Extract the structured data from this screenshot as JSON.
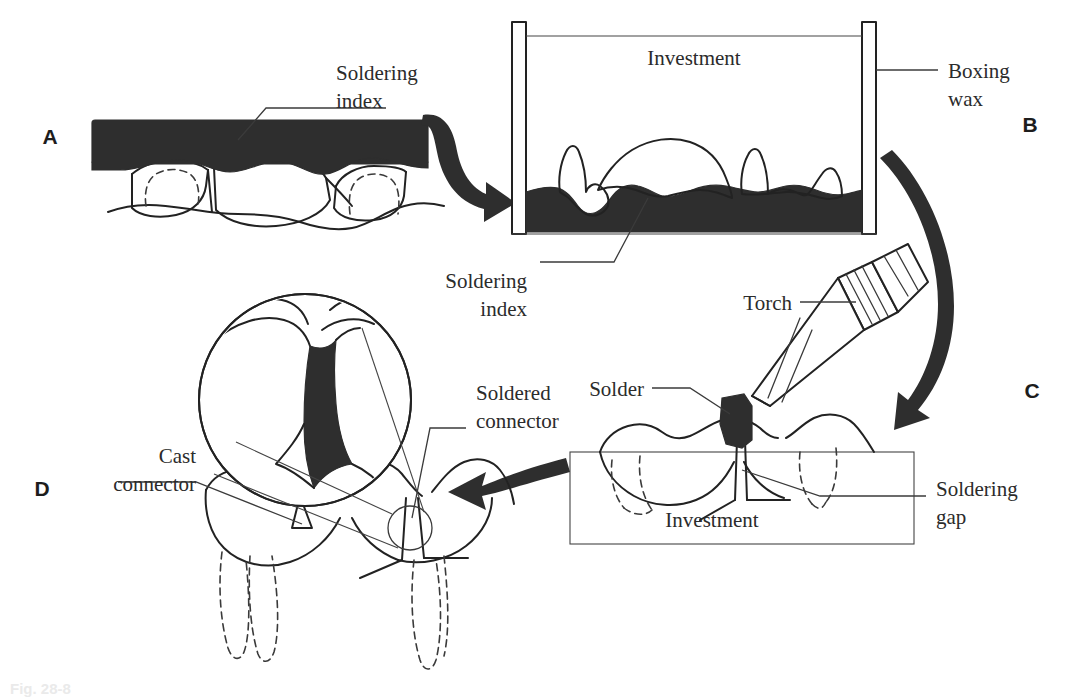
{
  "figure": {
    "caption": "Fig. 28-8",
    "ink_color": "#222222",
    "fill_color": "#2e2e2e",
    "background": "#ffffff"
  },
  "panels": [
    {
      "id": "A",
      "letter": "A",
      "description": "Soldering index seated over prepared teeth",
      "labels": [
        {
          "name": "soldering-index",
          "line1": "Soldering",
          "line2": "index"
        }
      ]
    },
    {
      "id": "B",
      "letter": "B",
      "description": "Index invested in a boxing wax container",
      "labels": [
        {
          "name": "investment",
          "line1": "Investment",
          "line2": ""
        },
        {
          "name": "boxing-wax",
          "line1": "Boxing",
          "line2": "wax"
        },
        {
          "name": "soldering-index",
          "line1": "Soldering",
          "line2": "index"
        }
      ]
    },
    {
      "id": "C",
      "letter": "C",
      "description": "Torch heating solder across the soldering gap",
      "labels": [
        {
          "name": "torch",
          "line1": "Torch",
          "line2": ""
        },
        {
          "name": "solder",
          "line1": "Solder",
          "line2": ""
        },
        {
          "name": "investment",
          "line1": "Investment",
          "line2": ""
        },
        {
          "name": "soldering-gap",
          "line1": "Soldering",
          "line2": "gap"
        }
      ]
    },
    {
      "id": "D",
      "letter": "D",
      "description": "Finished restoration with cast and soldered connectors, magnified inset",
      "labels": [
        {
          "name": "cast-connector",
          "line1": "Cast",
          "line2": "connector"
        },
        {
          "name": "soldered-connector",
          "line1": "Soldered",
          "line2": "connector"
        }
      ]
    }
  ],
  "arrows": [
    {
      "name": "arrow-a-to-b",
      "from": "A",
      "to": "B",
      "shape": "s-curve-right"
    },
    {
      "name": "arrow-b-to-c",
      "from": "B",
      "to": "C",
      "shape": "long-curve-down"
    },
    {
      "name": "arrow-c-to-d",
      "from": "C",
      "to": "D",
      "shape": "straight-left"
    }
  ]
}
